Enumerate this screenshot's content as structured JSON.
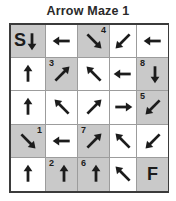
{
  "title": "Arrow Maze 1",
  "colors": {
    "shaded_cell": "#c9c9c9",
    "white_cell": "#ffffff",
    "outer_border": "#3b3b3b",
    "grid_line": "#9c9c9c",
    "ink": "#1c1c1c"
  },
  "grid": {
    "rows": 5,
    "cols": 5,
    "start_label": "S",
    "finish_label": "F",
    "cells": [
      {
        "row": 0,
        "col": 0,
        "shaded": true,
        "number": null,
        "number_pos": null,
        "letter": "S",
        "arrow": "down"
      },
      {
        "row": 0,
        "col": 1,
        "shaded": false,
        "number": null,
        "number_pos": null,
        "letter": null,
        "arrow": "left"
      },
      {
        "row": 0,
        "col": 2,
        "shaded": true,
        "number": "4",
        "number_pos": "tr",
        "letter": null,
        "arrow": "down-right"
      },
      {
        "row": 0,
        "col": 3,
        "shaded": false,
        "number": null,
        "number_pos": null,
        "letter": null,
        "arrow": "down-left"
      },
      {
        "row": 0,
        "col": 4,
        "shaded": false,
        "number": null,
        "number_pos": null,
        "letter": null,
        "arrow": "left"
      },
      {
        "row": 1,
        "col": 0,
        "shaded": false,
        "number": null,
        "number_pos": null,
        "letter": null,
        "arrow": "up"
      },
      {
        "row": 1,
        "col": 1,
        "shaded": true,
        "number": "3",
        "number_pos": "tl",
        "letter": null,
        "arrow": "up-right"
      },
      {
        "row": 1,
        "col": 2,
        "shaded": false,
        "number": null,
        "number_pos": null,
        "letter": null,
        "arrow": "up-left"
      },
      {
        "row": 1,
        "col": 3,
        "shaded": false,
        "number": null,
        "number_pos": null,
        "letter": null,
        "arrow": "left"
      },
      {
        "row": 1,
        "col": 4,
        "shaded": true,
        "number": "8",
        "number_pos": "tl",
        "letter": null,
        "arrow": "down"
      },
      {
        "row": 2,
        "col": 0,
        "shaded": false,
        "number": null,
        "number_pos": null,
        "letter": null,
        "arrow": "up"
      },
      {
        "row": 2,
        "col": 1,
        "shaded": false,
        "number": null,
        "number_pos": null,
        "letter": null,
        "arrow": "up-left"
      },
      {
        "row": 2,
        "col": 2,
        "shaded": false,
        "number": null,
        "number_pos": null,
        "letter": null,
        "arrow": "up-right"
      },
      {
        "row": 2,
        "col": 3,
        "shaded": false,
        "number": null,
        "number_pos": null,
        "letter": null,
        "arrow": "right"
      },
      {
        "row": 2,
        "col": 4,
        "shaded": true,
        "number": "5",
        "number_pos": "tl",
        "letter": null,
        "arrow": "down-left"
      },
      {
        "row": 3,
        "col": 0,
        "shaded": true,
        "number": "1",
        "number_pos": "tr",
        "letter": null,
        "arrow": "down-right"
      },
      {
        "row": 3,
        "col": 1,
        "shaded": false,
        "number": null,
        "number_pos": null,
        "letter": null,
        "arrow": "left"
      },
      {
        "row": 3,
        "col": 2,
        "shaded": true,
        "number": "7",
        "number_pos": "tl",
        "letter": null,
        "arrow": "up-right"
      },
      {
        "row": 3,
        "col": 3,
        "shaded": false,
        "number": null,
        "number_pos": null,
        "letter": null,
        "arrow": "up-left"
      },
      {
        "row": 3,
        "col": 4,
        "shaded": false,
        "number": null,
        "number_pos": null,
        "letter": null,
        "arrow": "down-left"
      },
      {
        "row": 4,
        "col": 0,
        "shaded": false,
        "number": null,
        "number_pos": null,
        "letter": null,
        "arrow": "up"
      },
      {
        "row": 4,
        "col": 1,
        "shaded": true,
        "number": "2",
        "number_pos": "tl",
        "letter": null,
        "arrow": "up"
      },
      {
        "row": 4,
        "col": 2,
        "shaded": true,
        "number": "6",
        "number_pos": "tl",
        "letter": null,
        "arrow": "up"
      },
      {
        "row": 4,
        "col": 3,
        "shaded": false,
        "number": null,
        "number_pos": null,
        "letter": null,
        "arrow": "up-left"
      },
      {
        "row": 4,
        "col": 4,
        "shaded": true,
        "number": null,
        "number_pos": null,
        "letter": "F",
        "arrow": null
      }
    ]
  }
}
